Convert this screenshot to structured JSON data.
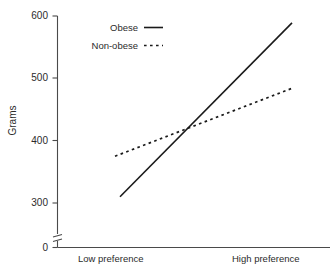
{
  "chart_data": {
    "type": "line",
    "title": "",
    "xlabel": "",
    "ylabel": "Grams",
    "categories": [
      "Low preference",
      "High preference"
    ],
    "x": [
      0,
      1
    ],
    "series": [
      {
        "name": "Obese",
        "values": [
          310,
          589
        ],
        "style": "solid"
      },
      {
        "name": "Non-obese",
        "values": [
          375,
          484
        ],
        "style": "dotted"
      }
    ],
    "ylim": [
      0,
      600
    ],
    "yticks": [
      0,
      300,
      400,
      500,
      600
    ],
    "ytick_labels": [
      "0",
      "300",
      "400",
      "500",
      "600"
    ],
    "axis_break": true,
    "axis_break_between": [
      0,
      300
    ],
    "grid": false,
    "legend_position": "top-left-inside",
    "annotations": [
      {
        "text": "lines cross at approximately 412 grams",
        "x": 0.51,
        "y": 412
      }
    ]
  },
  "axis": {
    "y_label": "Grams",
    "tick_600": "600",
    "tick_500": "500",
    "tick_400": "400",
    "tick_300": "300",
    "tick_0": "0",
    "x_low": "Low preference",
    "x_high": "High preference"
  },
  "legend": {
    "obese_label": "Obese",
    "nonobese_label": "Non-obese"
  },
  "colors": {
    "ink": "#1a1a1a",
    "axis": "#4a4a4a",
    "background": "#ffffff"
  }
}
